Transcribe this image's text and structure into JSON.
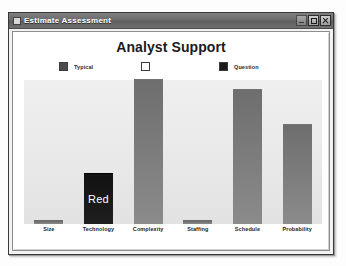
{
  "window": {
    "title": "Estimate Assessment",
    "app_icon": "app-icon",
    "controls": {
      "minimize": "minimize",
      "maximize": "maximize",
      "close": "close"
    }
  },
  "chart_data": {
    "type": "bar",
    "title": "Analyst Support",
    "xlabel": "",
    "ylabel": "",
    "grid": false,
    "ylim": [
      0,
      100
    ],
    "legend_position": "top",
    "categories": [
      "Size",
      "Technology",
      "Complexity",
      "Staffing",
      "Schedule",
      "Probability"
    ],
    "values": [
      2,
      35,
      100,
      2,
      93,
      69
    ],
    "bar_styles": [
      "flat",
      "dark",
      "normal",
      "flat",
      "normal",
      "normal"
    ],
    "bar_annotations": [
      "",
      "Red",
      "",
      "",
      "",
      ""
    ],
    "legend": [
      {
        "label": "Typical",
        "color": "#4c4c4c"
      },
      {
        "label": "",
        "color": "#ffffff"
      },
      {
        "label": "Question",
        "color": "#1a1a1a"
      }
    ]
  }
}
